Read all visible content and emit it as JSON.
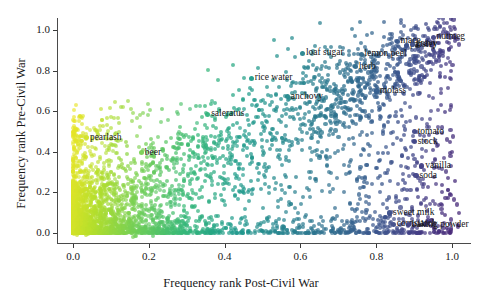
{
  "chart_data": {
    "type": "scatter",
    "title": "",
    "xlabel": "Frequency rank Post-Civil War",
    "ylabel": "Frequency rank Pre-Civil War",
    "xlim": [
      -0.04,
      1.05
    ],
    "ylim": [
      -0.05,
      1.06
    ],
    "xticks": [
      "0.0",
      "0.2",
      "0.4",
      "0.6",
      "0.8",
      "1.0"
    ],
    "xtick_values": [
      0.0,
      0.2,
      0.4,
      0.6,
      0.8,
      1.0
    ],
    "yticks": [
      "0.0",
      "0.2",
      "0.4",
      "0.6",
      "0.8",
      "1.0"
    ],
    "ytick_values": [
      0.0,
      0.2,
      0.4,
      0.6,
      0.8,
      1.0
    ],
    "grid": false,
    "legend": "none",
    "colormap": "viridis",
    "colormap_note": "point color varies from yellow-green at low x to blue-purple at high x",
    "marker_size": 4,
    "marker_alpha": 0.75,
    "labeled_points": [
      {
        "label": "pearlash",
        "x": 0.035,
        "y": 0.47
      },
      {
        "label": "beer",
        "x": 0.18,
        "y": 0.395
      },
      {
        "label": "saleratus",
        "x": 0.355,
        "y": 0.585
      },
      {
        "label": "rice water",
        "x": 0.47,
        "y": 0.762
      },
      {
        "label": "anchovy",
        "x": 0.565,
        "y": 0.672
      },
      {
        "label": "loaf sugar",
        "x": 0.605,
        "y": 0.885
      },
      {
        "label": "herb",
        "x": 0.745,
        "y": 0.82
      },
      {
        "label": "lemon peel",
        "x": 0.76,
        "y": 0.88
      },
      {
        "label": "molass",
        "x": 0.8,
        "y": 0.7
      },
      {
        "label": "mace",
        "x": 0.855,
        "y": 0.945
      },
      {
        "label": "parsley",
        "x": 0.88,
        "y": 0.925
      },
      {
        "label": "gravy",
        "x": 0.895,
        "y": 0.93
      },
      {
        "label": "nutmeg",
        "x": 0.95,
        "y": 0.965
      },
      {
        "label": "tomato",
        "x": 0.9,
        "y": 0.5
      },
      {
        "label": "stock",
        "x": 0.9,
        "y": 0.45
      },
      {
        "label": "vanilla",
        "x": 0.92,
        "y": 0.33
      },
      {
        "label": "soda",
        "x": 0.905,
        "y": 0.282
      },
      {
        "label": "sweet milk",
        "x": 0.835,
        "y": 0.098
      },
      {
        "label": "cornstarch",
        "x": 0.845,
        "y": 0.042
      },
      {
        "label": "baking powder",
        "x": 0.885,
        "y": 0.04
      }
    ]
  }
}
